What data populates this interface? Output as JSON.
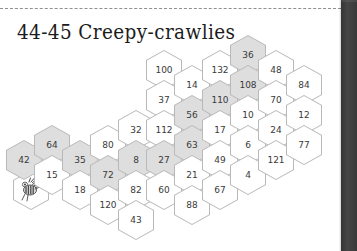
{
  "page": {
    "title": "44-45 Creepy-crawlies",
    "width": 357,
    "height": 251,
    "background": "#ffffff",
    "gutter_color": "#4a4a4a",
    "rule_style": "dashed"
  },
  "legend": {
    "shaded_color": "#dedede",
    "plain_color": "#ffffff",
    "outline_color": "#b9b9b9",
    "text_color": "#3a3a3a"
  },
  "icons": {
    "bee": "bee-icon"
  },
  "hex_grid": {
    "orientation": "pointy-top",
    "column_step_x": 28,
    "row_step_y": 30,
    "cells": [
      {
        "name": "bee",
        "label": "",
        "x": 31,
        "y": 190,
        "shaded": false,
        "icon": "bee-icon"
      },
      {
        "name": "cell-42",
        "label": "42",
        "x": 24,
        "y": 160,
        "shaded": true
      },
      {
        "name": "cell-64",
        "label": "64",
        "x": 52,
        "y": 145,
        "shaded": true
      },
      {
        "name": "cell-15",
        "label": "15",
        "x": 52,
        "y": 175,
        "shaded": false
      },
      {
        "name": "cell-35",
        "label": "35",
        "x": 80,
        "y": 160,
        "shaded": true
      },
      {
        "name": "cell-18",
        "label": "18",
        "x": 80,
        "y": 190,
        "shaded": false
      },
      {
        "name": "cell-80",
        "label": "80",
        "x": 108,
        "y": 145,
        "shaded": false
      },
      {
        "name": "cell-72",
        "label": "72",
        "x": 108,
        "y": 175,
        "shaded": true
      },
      {
        "name": "cell-120",
        "label": "120",
        "x": 108,
        "y": 205,
        "shaded": false
      },
      {
        "name": "cell-32",
        "label": "32",
        "x": 136,
        "y": 130,
        "shaded": false
      },
      {
        "name": "cell-8",
        "label": "8",
        "x": 136,
        "y": 160,
        "shaded": true
      },
      {
        "name": "cell-82",
        "label": "82",
        "x": 136,
        "y": 190,
        "shaded": false
      },
      {
        "name": "cell-43",
        "label": "43",
        "x": 136,
        "y": 220,
        "shaded": false
      },
      {
        "name": "cell-100",
        "label": "100",
        "x": 164,
        "y": 70,
        "shaded": false
      },
      {
        "name": "cell-37",
        "label": "37",
        "x": 164,
        "y": 100,
        "shaded": false
      },
      {
        "name": "cell-112",
        "label": "112",
        "x": 164,
        "y": 130,
        "shaded": false
      },
      {
        "name": "cell-27",
        "label": "27",
        "x": 164,
        "y": 160,
        "shaded": true
      },
      {
        "name": "cell-60",
        "label": "60",
        "x": 164,
        "y": 190,
        "shaded": false
      },
      {
        "name": "cell-14",
        "label": "14",
        "x": 192,
        "y": 85,
        "shaded": false
      },
      {
        "name": "cell-56",
        "label": "56",
        "x": 192,
        "y": 115,
        "shaded": true
      },
      {
        "name": "cell-63",
        "label": "63",
        "x": 192,
        "y": 145,
        "shaded": true
      },
      {
        "name": "cell-21",
        "label": "21",
        "x": 192,
        "y": 175,
        "shaded": false
      },
      {
        "name": "cell-88",
        "label": "88",
        "x": 192,
        "y": 205,
        "shaded": false
      },
      {
        "name": "cell-132",
        "label": "132",
        "x": 220,
        "y": 70,
        "shaded": false
      },
      {
        "name": "cell-110",
        "label": "110",
        "x": 220,
        "y": 100,
        "shaded": true
      },
      {
        "name": "cell-17",
        "label": "17",
        "x": 220,
        "y": 130,
        "shaded": false
      },
      {
        "name": "cell-49",
        "label": "49",
        "x": 220,
        "y": 160,
        "shaded": false
      },
      {
        "name": "cell-67",
        "label": "67",
        "x": 220,
        "y": 190,
        "shaded": false
      },
      {
        "name": "cell-36",
        "label": "36",
        "x": 248,
        "y": 55,
        "shaded": true
      },
      {
        "name": "cell-108",
        "label": "108",
        "x": 248,
        "y": 85,
        "shaded": true
      },
      {
        "name": "cell-10",
        "label": "10",
        "x": 248,
        "y": 115,
        "shaded": false
      },
      {
        "name": "cell-6",
        "label": "6",
        "x": 248,
        "y": 145,
        "shaded": false
      },
      {
        "name": "cell-4",
        "label": "4",
        "x": 248,
        "y": 175,
        "shaded": false
      },
      {
        "name": "cell-48",
        "label": "48",
        "x": 276,
        "y": 70,
        "shaded": false
      },
      {
        "name": "cell-70",
        "label": "70",
        "x": 276,
        "y": 100,
        "shaded": false
      },
      {
        "name": "cell-24",
        "label": "24",
        "x": 276,
        "y": 130,
        "shaded": false
      },
      {
        "name": "cell-121",
        "label": "121",
        "x": 276,
        "y": 160,
        "shaded": false
      },
      {
        "name": "cell-84",
        "label": "84",
        "x": 304,
        "y": 85,
        "shaded": false
      },
      {
        "name": "cell-12",
        "label": "12",
        "x": 304,
        "y": 115,
        "shaded": false
      },
      {
        "name": "cell-77",
        "label": "77",
        "x": 304,
        "y": 145,
        "shaded": false
      }
    ]
  }
}
